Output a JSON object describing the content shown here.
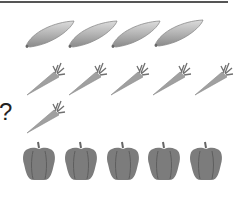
{
  "question_mark": "?",
  "colors": {
    "rule": "#555555",
    "zucchini_light": "#c8c8c8",
    "zucchini_dark": "#8a8a8a",
    "carrot": "#9a9a9a",
    "carrot_top": "#7a7a7a",
    "pepper": "#7c7c7c",
    "pepper_dark": "#5e5e5e"
  },
  "rows": [
    {
      "name": "zucchini-row",
      "item": "zucchini",
      "count": 4
    },
    {
      "name": "carrot-row",
      "item": "carrot",
      "count": 5
    },
    {
      "name": "carrot-question-row",
      "item": "carrot",
      "count": 1,
      "label": "?"
    },
    {
      "name": "pepper-row",
      "item": "bell-pepper",
      "count": 5
    }
  ]
}
